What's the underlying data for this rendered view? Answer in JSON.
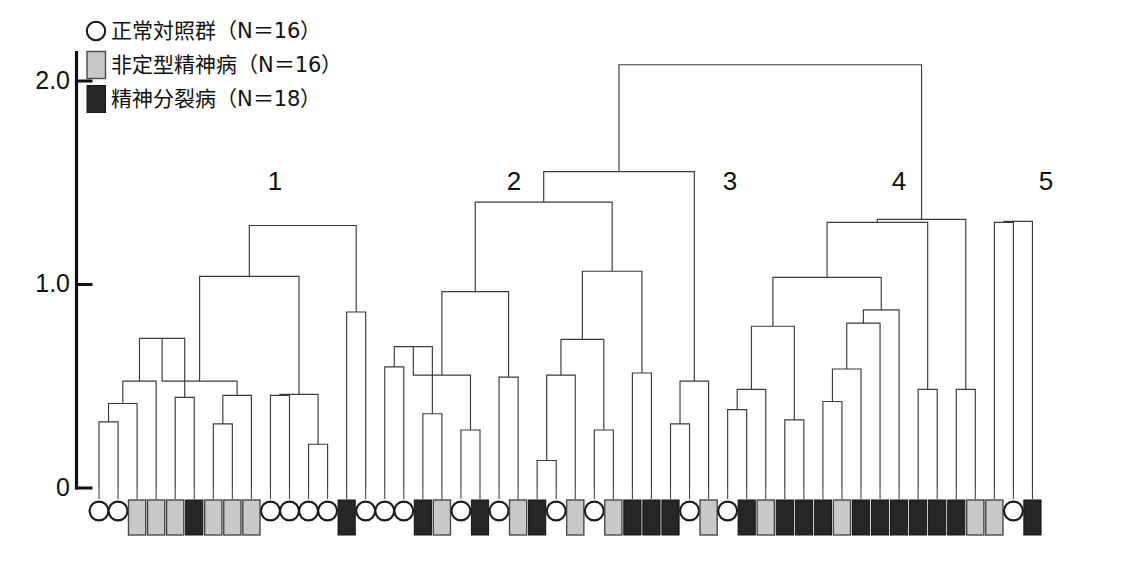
{
  "figure": {
    "kind": "dendrogram",
    "background": "#ffffff",
    "line_color": "#3b3b3b",
    "axis_color": "#111111"
  },
  "legend": {
    "position": "top-left",
    "items": [
      {
        "symbol": "circle",
        "swatch": "#ffffff",
        "label": "正常対照群（N＝16）",
        "group": "normal-control",
        "n": 16
      },
      {
        "symbol": "square",
        "swatch": "#c9c9c9",
        "label": "非定型精神病（N＝16）",
        "group": "atypical-psychosis",
        "n": 16
      },
      {
        "symbol": "square",
        "swatch": "#262626",
        "label": "精神分裂病（N＝18）",
        "group": "schizophrenia",
        "n": 18
      }
    ]
  },
  "axis": {
    "orientation": "vertical",
    "ticks": [
      {
        "value": 2.0,
        "label": "2.0",
        "y": 81
      },
      {
        "value": 1.0,
        "label": "1.0",
        "y": 268
      },
      {
        "value": 0,
        "label": "0",
        "y": 488
      }
    ],
    "ylabel": "",
    "ylim": [
      0,
      2.15
    ]
  },
  "cluster_labels": [
    {
      "text": "1",
      "x": 275,
      "y": 190
    },
    {
      "text": "2",
      "x": 514,
      "y": 190
    },
    {
      "text": "3",
      "x": 730,
      "y": 190
    },
    {
      "text": "4",
      "x": 899,
      "y": 190
    },
    {
      "text": "5",
      "x": 1046,
      "y": 190
    }
  ],
  "chart_data": {
    "type": "dendrogram",
    "title": "",
    "xlabel": "",
    "ylabel": "",
    "ylim": [
      0,
      2.15
    ],
    "yticks": [
      0,
      1.0,
      2.0
    ],
    "n_leaves": 50,
    "leaf_start_x": 99,
    "leaf_step": 19.05,
    "groups": {
      "normal-control": {
        "symbol": "circle",
        "fill": "#ffffff",
        "count": 16
      },
      "atypical-psychosis": {
        "symbol": "square",
        "fill": "#c9c9c9",
        "count": 16
      },
      "schizophrenia": {
        "symbol": "square",
        "fill": "#262626",
        "count": 18
      }
    },
    "leaves": [
      {
        "i": 0,
        "group": "normal-control"
      },
      {
        "i": 1,
        "group": "normal-control"
      },
      {
        "i": 2,
        "group": "atypical-psychosis"
      },
      {
        "i": 3,
        "group": "atypical-psychosis"
      },
      {
        "i": 4,
        "group": "atypical-psychosis"
      },
      {
        "i": 5,
        "group": "schizophrenia"
      },
      {
        "i": 6,
        "group": "atypical-psychosis"
      },
      {
        "i": 7,
        "group": "atypical-psychosis"
      },
      {
        "i": 8,
        "group": "atypical-psychosis"
      },
      {
        "i": 9,
        "group": "normal-control"
      },
      {
        "i": 10,
        "group": "normal-control"
      },
      {
        "i": 11,
        "group": "normal-control"
      },
      {
        "i": 12,
        "group": "normal-control"
      },
      {
        "i": 13,
        "group": "schizophrenia"
      },
      {
        "i": 14,
        "group": "normal-control"
      },
      {
        "i": 15,
        "group": "normal-control"
      },
      {
        "i": 16,
        "group": "normal-control"
      },
      {
        "i": 17,
        "group": "schizophrenia"
      },
      {
        "i": 18,
        "group": "atypical-psychosis"
      },
      {
        "i": 19,
        "group": "normal-control"
      },
      {
        "i": 20,
        "group": "schizophrenia"
      },
      {
        "i": 21,
        "group": "normal-control"
      },
      {
        "i": 22,
        "group": "atypical-psychosis"
      },
      {
        "i": 23,
        "group": "schizophrenia"
      },
      {
        "i": 24,
        "group": "normal-control"
      },
      {
        "i": 25,
        "group": "atypical-psychosis"
      },
      {
        "i": 26,
        "group": "normal-control"
      },
      {
        "i": 27,
        "group": "atypical-psychosis"
      },
      {
        "i": 28,
        "group": "schizophrenia"
      },
      {
        "i": 29,
        "group": "schizophrenia"
      },
      {
        "i": 30,
        "group": "schizophrenia"
      },
      {
        "i": 31,
        "group": "normal-control"
      },
      {
        "i": 32,
        "group": "atypical-psychosis"
      },
      {
        "i": 33,
        "group": "normal-control"
      },
      {
        "i": 34,
        "group": "schizophrenia"
      },
      {
        "i": 35,
        "group": "atypical-psychosis"
      },
      {
        "i": 36,
        "group": "schizophrenia"
      },
      {
        "i": 37,
        "group": "schizophrenia"
      },
      {
        "i": 38,
        "group": "schizophrenia"
      },
      {
        "i": 39,
        "group": "atypical-psychosis"
      },
      {
        "i": 40,
        "group": "schizophrenia"
      },
      {
        "i": 41,
        "group": "schizophrenia"
      },
      {
        "i": 42,
        "group": "schizophrenia"
      },
      {
        "i": 43,
        "group": "schizophrenia"
      },
      {
        "i": 44,
        "group": "schizophrenia"
      },
      {
        "i": 45,
        "group": "schizophrenia"
      },
      {
        "i": 46,
        "group": "atypical-psychosis"
      },
      {
        "i": 47,
        "group": "atypical-psychosis"
      },
      {
        "i": 48,
        "group": "normal-control"
      },
      {
        "i": 49,
        "group": "schizophrenia"
      }
    ],
    "merges": [
      {
        "id": "m1",
        "left": {
          "t": "leaf",
          "i": 0
        },
        "right": {
          "t": "leaf",
          "i": 1
        },
        "height": 0.325
      },
      {
        "id": "m2",
        "left": {
          "t": "node",
          "id": "m1"
        },
        "right": {
          "t": "leaf",
          "i": 2
        },
        "height": 0.415
      },
      {
        "id": "m3",
        "left": {
          "t": "node",
          "id": "m2"
        },
        "right": {
          "t": "leaf",
          "i": 3
        },
        "height": 0.525
      },
      {
        "id": "m4",
        "left": {
          "t": "leaf",
          "i": 4
        },
        "right": {
          "t": "leaf",
          "i": 5
        },
        "height": 0.445
      },
      {
        "id": "m5",
        "left": {
          "t": "node",
          "id": "m3"
        },
        "right": {
          "t": "node",
          "id": "m4"
        },
        "height": 0.735
      },
      {
        "id": "m6",
        "left": {
          "t": "leaf",
          "i": 6
        },
        "right": {
          "t": "leaf",
          "i": 7
        },
        "height": 0.315
      },
      {
        "id": "m7",
        "left": {
          "t": "node",
          "id": "m6"
        },
        "right": {
          "t": "leaf",
          "i": 8
        },
        "height": 0.455
      },
      {
        "id": "m8",
        "left": {
          "t": "node",
          "id": "m5"
        },
        "right": {
          "t": "node",
          "id": "m7"
        },
        "height": 0.525
      },
      {
        "id": "m9",
        "left": {
          "t": "leaf",
          "i": 9
        },
        "right": {
          "t": "leaf",
          "i": 10
        },
        "height": 0.455
      },
      {
        "id": "m10",
        "left": {
          "t": "leaf",
          "i": 11
        },
        "right": {
          "t": "leaf",
          "i": 12
        },
        "height": 0.215
      },
      {
        "id": "m11",
        "left": {
          "t": "node",
          "id": "m9"
        },
        "right": {
          "t": "node",
          "id": "m10"
        },
        "height": 0.46
      },
      {
        "id": "m12",
        "left": {
          "t": "node",
          "id": "m8"
        },
        "right": {
          "t": "node",
          "id": "m11"
        },
        "height": 1.04
      },
      {
        "id": "m13",
        "left": {
          "t": "leaf",
          "i": 13
        },
        "right": {
          "t": "leaf",
          "i": 14
        },
        "height": 0.865
      },
      {
        "id": "m14",
        "left": {
          "t": "node",
          "id": "m12"
        },
        "right": {
          "t": "node",
          "id": "m13"
        },
        "height": 1.29
      },
      {
        "id": "m15",
        "left": {
          "t": "leaf",
          "i": 15
        },
        "right": {
          "t": "leaf",
          "i": 16
        },
        "height": 0.595
      },
      {
        "id": "m16",
        "left": {
          "t": "leaf",
          "i": 17
        },
        "right": {
          "t": "leaf",
          "i": 18
        },
        "height": 0.365
      },
      {
        "id": "m17",
        "left": {
          "t": "node",
          "id": "m15"
        },
        "right": {
          "t": "node",
          "id": "m16"
        },
        "height": 0.695
      },
      {
        "id": "m18",
        "left": {
          "t": "leaf",
          "i": 19
        },
        "right": {
          "t": "leaf",
          "i": 20
        },
        "height": 0.285
      },
      {
        "id": "m19",
        "left": {
          "t": "node",
          "id": "m17"
        },
        "right": {
          "t": "node",
          "id": "m18"
        },
        "height": 0.555
      },
      {
        "id": "m20",
        "left": {
          "t": "leaf",
          "i": 21
        },
        "right": {
          "t": "leaf",
          "i": 22
        },
        "height": 0.545
      },
      {
        "id": "m21",
        "left": {
          "t": "node",
          "id": "m19"
        },
        "right": {
          "t": "node",
          "id": "m20"
        },
        "height": 0.965
      },
      {
        "id": "m22",
        "left": {
          "t": "leaf",
          "i": 23
        },
        "right": {
          "t": "leaf",
          "i": 24
        },
        "height": 0.135
      },
      {
        "id": "m23",
        "left": {
          "t": "node",
          "id": "m22"
        },
        "right": {
          "t": "leaf",
          "i": 25
        },
        "height": 0.555
      },
      {
        "id": "m24",
        "left": {
          "t": "leaf",
          "i": 26
        },
        "right": {
          "t": "leaf",
          "i": 27
        },
        "height": 0.285
      },
      {
        "id": "m25",
        "left": {
          "t": "node",
          "id": "m23"
        },
        "right": {
          "t": "node",
          "id": "m24"
        },
        "height": 0.73
      },
      {
        "id": "m26",
        "left": {
          "t": "leaf",
          "i": 28
        },
        "right": {
          "t": "leaf",
          "i": 29
        },
        "height": 0.565
      },
      {
        "id": "m27",
        "left": {
          "t": "node",
          "id": "m25"
        },
        "right": {
          "t": "node",
          "id": "m26"
        },
        "height": 1.065
      },
      {
        "id": "m28",
        "left": {
          "t": "node",
          "id": "m21"
        },
        "right": {
          "t": "node",
          "id": "m27"
        },
        "height": 1.405
      },
      {
        "id": "m29",
        "left": {
          "t": "leaf",
          "i": 30
        },
        "right": {
          "t": "leaf",
          "i": 31
        },
        "height": 0.315
      },
      {
        "id": "m30",
        "left": {
          "t": "node",
          "id": "m29"
        },
        "right": {
          "t": "leaf",
          "i": 32
        },
        "height": 0.525
      },
      {
        "id": "m31",
        "left": {
          "t": "node",
          "id": "m28"
        },
        "right": {
          "t": "node",
          "id": "m30"
        },
        "height": 1.555
      },
      {
        "id": "m32",
        "left": {
          "t": "leaf",
          "i": 33
        },
        "right": {
          "t": "leaf",
          "i": 34
        },
        "height": 0.385
      },
      {
        "id": "m33",
        "left": {
          "t": "node",
          "id": "m32"
        },
        "right": {
          "t": "leaf",
          "i": 35
        },
        "height": 0.485
      },
      {
        "id": "m34",
        "left": {
          "t": "leaf",
          "i": 36
        },
        "right": {
          "t": "leaf",
          "i": 37
        },
        "height": 0.335
      },
      {
        "id": "m35",
        "left": {
          "t": "node",
          "id": "m33"
        },
        "right": {
          "t": "node",
          "id": "m34"
        },
        "height": 0.795
      },
      {
        "id": "m36",
        "left": {
          "t": "leaf",
          "i": 38
        },
        "right": {
          "t": "leaf",
          "i": 39
        },
        "height": 0.425
      },
      {
        "id": "m37",
        "left": {
          "t": "node",
          "id": "m36"
        },
        "right": {
          "t": "leaf",
          "i": 40
        },
        "height": 0.585
      },
      {
        "id": "m38",
        "left": {
          "t": "node",
          "id": "m37"
        },
        "right": {
          "t": "leaf",
          "i": 41
        },
        "height": 0.81
      },
      {
        "id": "m39",
        "left": {
          "t": "node",
          "id": "m38"
        },
        "right": {
          "t": "leaf",
          "i": 42
        },
        "height": 0.875
      },
      {
        "id": "m40",
        "left": {
          "t": "node",
          "id": "m35"
        },
        "right": {
          "t": "node",
          "id": "m39"
        },
        "height": 1.035
      },
      {
        "id": "m41",
        "left": {
          "t": "leaf",
          "i": 43
        },
        "right": {
          "t": "leaf",
          "i": 44
        },
        "height": 0.485
      },
      {
        "id": "m42",
        "left": {
          "t": "node",
          "id": "m40"
        },
        "right": {
          "t": "node",
          "id": "m41"
        },
        "height": 1.305
      },
      {
        "id": "m43",
        "left": {
          "t": "leaf",
          "i": 45
        },
        "right": {
          "t": "leaf",
          "i": 46
        },
        "height": 0.485
      },
      {
        "id": "m44",
        "left": {
          "t": "node",
          "id": "m42"
        },
        "right": {
          "t": "node",
          "id": "m43"
        },
        "height": 1.32
      },
      {
        "id": "m45",
        "left": {
          "t": "leaf",
          "i": 47
        },
        "right": {
          "t": "leaf",
          "i": 48
        },
        "height": 1.305
      },
      {
        "id": "m46",
        "left": {
          "t": "node",
          "id": "m45"
        },
        "right": {
          "t": "leaf",
          "i": 49
        },
        "height": 1.31
      },
      {
        "id": "m47",
        "left": {
          "t": "node",
          "id": "m31"
        },
        "right": {
          "t": "node",
          "id": "m44"
        },
        "height": 2.08
      }
    ],
    "clusters": [
      {
        "name": "1",
        "leaf_from": 0,
        "leaf_to": 14
      },
      {
        "name": "2",
        "leaf_from": 15,
        "leaf_to": 22
      },
      {
        "name": "3",
        "leaf_from": 23,
        "leaf_to": 32
      },
      {
        "name": "4",
        "leaf_from": 33,
        "leaf_to": 46
      },
      {
        "name": "5",
        "leaf_from": 47,
        "leaf_to": 49
      }
    ]
  }
}
